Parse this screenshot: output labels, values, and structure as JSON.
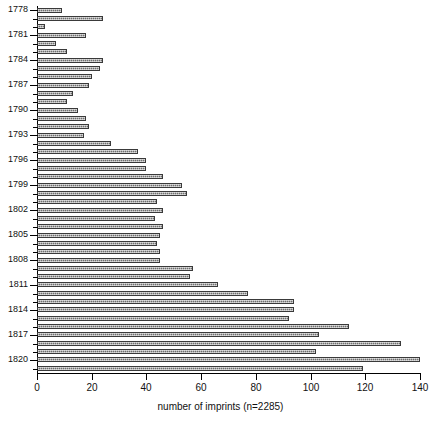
{
  "chart_data": {
    "type": "bar",
    "orientation": "horizontal",
    "title": "",
    "xlabel": "number of imprints (n=2285)",
    "ylabel": "",
    "xlim": [
      0,
      140
    ],
    "xticks": [
      0,
      20,
      40,
      60,
      80,
      100,
      120,
      140
    ],
    "grid": false,
    "legend": null,
    "bar_color": "#6e6e6e",
    "categories": [
      "1778",
      "1779",
      "1780",
      "1781",
      "1782",
      "1783",
      "1784",
      "1785",
      "1786",
      "1787",
      "1788",
      "1789",
      "1790",
      "1791",
      "1792",
      "1793",
      "1794",
      "1795",
      "1796",
      "1797",
      "1798",
      "1799",
      "1800",
      "1801",
      "1802",
      "1803",
      "1804",
      "1805",
      "1806",
      "1807",
      "1808",
      "1809",
      "1810",
      "1811",
      "1812",
      "1813",
      "1814",
      "1815",
      "1816",
      "1817",
      "1818",
      "1819",
      "1820",
      "1821"
    ],
    "labeled_categories": [
      "1778",
      "1781",
      "1784",
      "1787",
      "1790",
      "1793",
      "1796",
      "1799",
      "1802",
      "1805",
      "1808",
      "1811",
      "1814",
      "1817",
      "1820"
    ],
    "values": [
      9,
      24,
      3,
      18,
      7,
      11,
      24,
      23,
      20,
      19,
      13,
      11,
      15,
      18,
      19,
      17,
      27,
      37,
      40,
      40,
      46,
      53,
      55,
      44,
      46,
      43,
      46,
      45,
      44,
      45,
      45,
      57,
      56,
      66,
      77,
      94,
      94,
      92,
      114,
      103,
      133,
      102,
      140,
      119
    ]
  },
  "axis": {
    "x_tick_labels": [
      "0",
      "20",
      "40",
      "60",
      "80",
      "100",
      "120",
      "140"
    ]
  }
}
